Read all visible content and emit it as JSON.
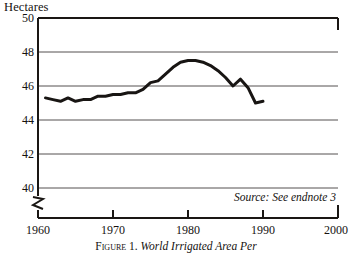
{
  "chart_data": {
    "type": "line",
    "title": "",
    "ylabel": "Hectares",
    "xlabel": "",
    "ylim": [
      38.6,
      50
    ],
    "xlim": [
      1960,
      2000
    ],
    "grid": true,
    "legend": false,
    "axis_break": true,
    "yticks": [
      50,
      48,
      46,
      44,
      42,
      40
    ],
    "xticks": [
      1960,
      1970,
      1980,
      1990,
      2000
    ],
    "source_note": "Source: See endnote 3",
    "caption_label": "Figure 1.",
    "caption_title": "World Irrigated Area Per",
    "series": [
      {
        "name": "World irrigated area per thousand people",
        "x": [
          1961,
          1962,
          1963,
          1964,
          1965,
          1966,
          1967,
          1968,
          1969,
          1970,
          1971,
          1972,
          1973,
          1974,
          1975,
          1976,
          1977,
          1978,
          1979,
          1980,
          1981,
          1982,
          1983,
          1984,
          1985,
          1986,
          1987,
          1988,
          1989,
          1990
        ],
        "values": [
          45.3,
          45.2,
          45.1,
          45.3,
          45.1,
          45.2,
          45.2,
          45.4,
          45.4,
          45.5,
          45.5,
          45.6,
          45.6,
          45.8,
          46.2,
          46.3,
          46.7,
          47.1,
          47.4,
          47.5,
          47.5,
          47.4,
          47.2,
          46.9,
          46.5,
          46.0,
          46.4,
          45.9,
          45.0,
          45.1
        ]
      }
    ]
  },
  "yticks": {
    "t0": "50",
    "t1": "48",
    "t2": "46",
    "t3": "44",
    "t4": "42",
    "t5": "40"
  },
  "xticks": {
    "t0": "1960",
    "t1": "1970",
    "t2": "1980",
    "t3": "1990",
    "t4": "2000"
  },
  "labels": {
    "y_axis_title": "Hectares",
    "source_note": "Source: See endnote 3",
    "caption_label": "Figure 1.",
    "caption_title": "World Irrigated Area Per"
  },
  "colors": {
    "axis": "#1a1714",
    "grid": "#555050",
    "line": "#181513",
    "background": "#ffffff"
  }
}
